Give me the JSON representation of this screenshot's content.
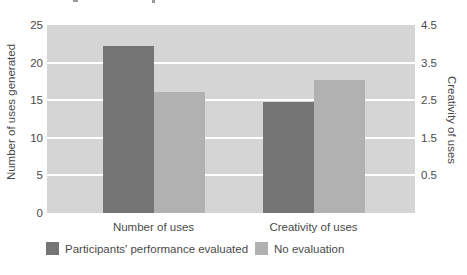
{
  "chart_data": {
    "type": "bar",
    "title": "",
    "categories": [
      "Number of uses",
      "Creativity of uses"
    ],
    "series": [
      {
        "name": "Participants' performance evaluated",
        "color": "#757575",
        "values": [
          22.2,
          2.45
        ],
        "value_axes": [
          "left",
          "right"
        ]
      },
      {
        "name": "No evaluation",
        "color": "#b1b1b1",
        "values": [
          16.1,
          3.05
        ],
        "value_axes": [
          "left",
          "right"
        ]
      }
    ],
    "left_axis": {
      "label": "Number of uses generated",
      "range": [
        0,
        25
      ],
      "ticks": [
        0,
        5,
        10,
        15,
        20,
        25
      ]
    },
    "right_axis": {
      "label": "Creativity of uses",
      "ticks": [
        0.5,
        1.5,
        2.5,
        3.5,
        4.5
      ],
      "alignment": "right tick r sits at left-axis value (r + 0.5) * 5"
    },
    "grid": true,
    "gridline_values": [
      5,
      10,
      15,
      20
    ],
    "gridline_color": "#ffffff",
    "plot_background": "#d5d5d5",
    "legend_position": "bottom"
  }
}
